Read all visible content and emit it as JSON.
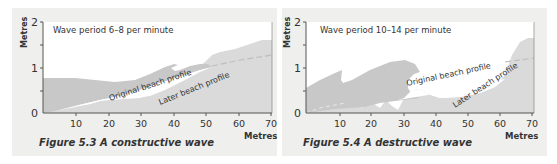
{
  "figures": [
    {
      "caption": "Figure 5.3 A constructive wave",
      "annotation": "Wave period 6–8 per minute",
      "ylabel": "Metres",
      "xlabel": "Metres",
      "yticks": [
        "0",
        "1",
        "2"
      ],
      "xticks": [
        "10",
        "20",
        "30",
        "40",
        "50",
        "60",
        "70"
      ],
      "labels": {
        "original": "Original beach profile",
        "later": "Later beach profile"
      }
    },
    {
      "caption": "Figure 5.4 A destructive wave",
      "annotation": "Wave period 10–14 per minute",
      "ylabel": "Metres",
      "xlabel": "Metres",
      "yticks": [
        "0",
        "1",
        "2"
      ],
      "xticks": [
        "10",
        "20",
        "30",
        "40",
        "50",
        "60",
        "70"
      ],
      "labels": {
        "original": "Original beach profile",
        "later": "Later beach profile"
      }
    }
  ],
  "colors": {
    "panel_bg": "#efefee",
    "plot_bg": "#ffffff",
    "sea": "#c8c8c8",
    "beach": "#dadada",
    "axis": "#555555",
    "text": "#333333"
  }
}
